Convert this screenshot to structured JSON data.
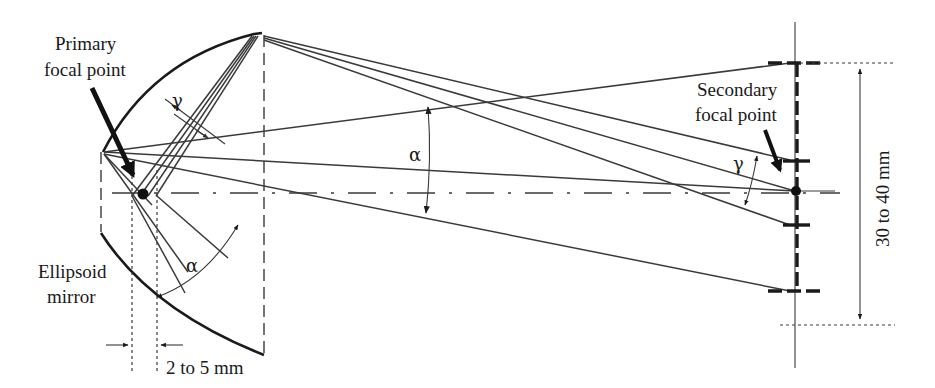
{
  "figure": {
    "labels": {
      "primary_focal_point_line1": "Primary",
      "primary_focal_point_line2": "focal point",
      "secondary_focal_point_line1": "Secondary",
      "secondary_focal_point_line2": "focal point",
      "ellipsoid_mirror_line1": "Ellipsoid",
      "ellipsoid_mirror_line2": "mirror",
      "defocus_range": "2 to 5 mm",
      "spot_range": "30 to 40 mm"
    },
    "angles": {
      "gamma_near_mirror": "γ",
      "alpha_near_mirror": "α",
      "alpha_middle": "α",
      "gamma_near_secondary": "γ"
    },
    "colors": {
      "line": "#3a3a3a",
      "strong": "#1a1a1a",
      "background": "#ffffff"
    }
  }
}
